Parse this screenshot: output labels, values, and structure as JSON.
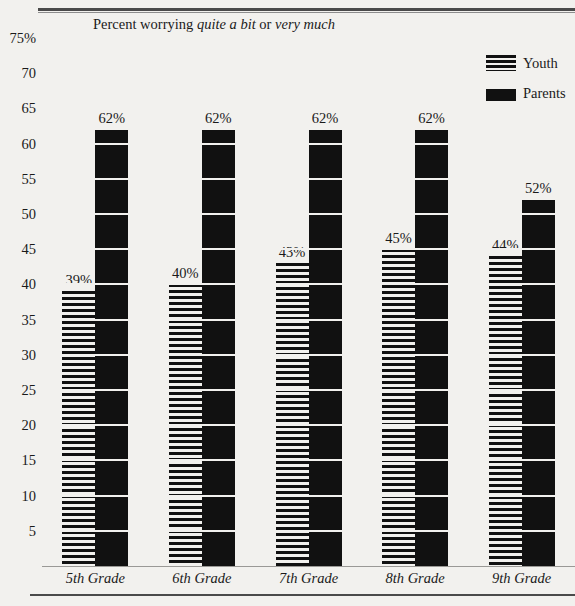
{
  "chart_data": {
    "type": "bar",
    "title": "Percent worrying quite a bit or very much",
    "title_parts": [
      {
        "text": "Percent worrying ",
        "italic": false
      },
      {
        "text": "quite a bit",
        "italic": true
      },
      {
        "text": " or ",
        "italic": false
      },
      {
        "text": "very much",
        "italic": true
      }
    ],
    "xlabel": "",
    "ylabel": "",
    "ylim": [
      0,
      75
    ],
    "grid": true,
    "legend_position": "top-right",
    "categories": [
      "5th Grade",
      "6th Grade",
      "7th Grade",
      "8th Grade",
      "9th Grade"
    ],
    "ytick_labels": [
      "75%",
      "70",
      "65",
      "60",
      "55",
      "50",
      "45",
      "40",
      "35",
      "30",
      "25",
      "20",
      "15",
      "10",
      "5"
    ],
    "ytick_values": [
      75,
      70,
      65,
      60,
      55,
      50,
      45,
      40,
      35,
      30,
      25,
      20,
      15,
      10,
      5
    ],
    "series": [
      {
        "name": "Youth",
        "pattern": "horizontal-stripes",
        "color": "#111111",
        "values": [
          39,
          40,
          43,
          45,
          44
        ],
        "labels": [
          "39%",
          "40%",
          "43%",
          "45%",
          "44%"
        ]
      },
      {
        "name": "Parents",
        "pattern": "solid",
        "color": "#111111",
        "values": [
          62,
          62,
          62,
          62,
          52
        ],
        "labels": [
          "62%",
          "62%",
          "62%",
          "62%",
          "52%"
        ]
      }
    ]
  },
  "legend": {
    "items": [
      {
        "label": "Youth",
        "swatch": "youth"
      },
      {
        "label": "Parents",
        "swatch": "parents"
      }
    ]
  },
  "colors": {
    "background": "#f2f1ee",
    "ink": "#1a1a1a",
    "gridline": "#b9b8b5",
    "rule": "#4a4a4a"
  }
}
